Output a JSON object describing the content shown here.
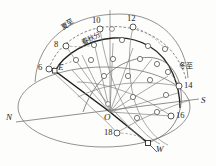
{
  "figure": {
    "colors": {
      "line": "#5a5a5a",
      "line_light": "#8d8d8d",
      "line_bold": "#1a1a1a",
      "marker_fill": "#ffffff",
      "marker_stroke": "#4a4a4a",
      "text": "#1c1c1c",
      "background": "#fdfdfc"
    },
    "cardinal_labels": [
      {
        "id": "north",
        "text": "N",
        "x": 6,
        "y": 118
      },
      {
        "id": "south",
        "text": "S",
        "x": 201,
        "y": 101
      },
      {
        "id": "east",
        "text": "E",
        "x": 58,
        "y": 69
      },
      {
        "id": "west",
        "text": "W",
        "x": 156,
        "y": 150
      },
      {
        "id": "origin",
        "text": "O",
        "x": 105,
        "y": 112
      }
    ],
    "hour_labels": [
      {
        "id": "hour-6",
        "text": "6",
        "x": 39,
        "y": 67
      },
      {
        "id": "hour-8",
        "text": "8",
        "x": 55,
        "y": 42
      },
      {
        "id": "hour-10",
        "text": "10",
        "x": 92,
        "y": 19
      },
      {
        "id": "hour-12",
        "text": "12",
        "x": 127,
        "y": 17
      },
      {
        "id": "hour-14",
        "text": "14",
        "x": 184,
        "y": 85
      },
      {
        "id": "hour-16",
        "text": "16",
        "x": 177,
        "y": 113
      },
      {
        "id": "hour-18",
        "text": "18",
        "x": 105,
        "y": 131
      }
    ],
    "season_labels": [
      {
        "id": "summer-solstice",
        "text": "夏至",
        "x": 68,
        "y": 28,
        "rotate": -32
      },
      {
        "id": "equinox",
        "text": "春秋分",
        "x": 85,
        "y": 41,
        "rotate": -30
      },
      {
        "id": "winter-solstice",
        "text": "冬至",
        "x": 180,
        "y": 66,
        "rotate": 0
      }
    ],
    "hour_markers": [
      {
        "id": "marker-6",
        "cx": 49,
        "cy": 69
      },
      {
        "id": "marker-8",
        "cx": 66,
        "cy": 46
      },
      {
        "id": "marker-10",
        "cx": 100,
        "cy": 29
      },
      {
        "id": "marker-12",
        "cx": 133,
        "cy": 27
      },
      {
        "id": "marker-14",
        "cx": 179,
        "cy": 86
      },
      {
        "id": "marker-16",
        "cx": 171,
        "cy": 116
      },
      {
        "id": "marker-18",
        "cx": 117,
        "cy": 133
      }
    ]
  }
}
